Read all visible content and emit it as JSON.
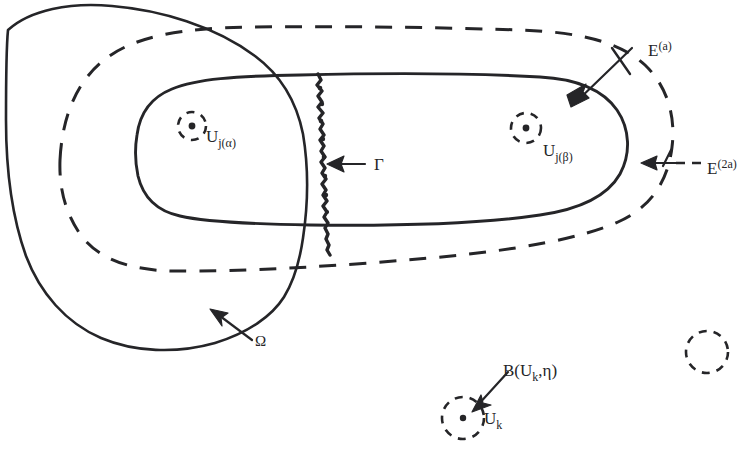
{
  "figure": {
    "background_color": "#ffffff",
    "ink_color": "#252528",
    "width": 751,
    "height": 455
  },
  "labels": {
    "e_a": {
      "base": "E",
      "exponent": "(a)",
      "full": "E^(a)"
    },
    "e_2a": {
      "base": "E",
      "exponent": "(2a)",
      "full": "E^(2a)"
    },
    "u_j_alpha": {
      "base": "U",
      "subscript": "j(α)",
      "full": "U_j(α)"
    },
    "u_j_beta": {
      "base": "U",
      "subscript": "j(β)",
      "full": "U_j(β)"
    },
    "gamma": {
      "full": "Γ"
    },
    "omega": {
      "full": "Ω"
    },
    "b_uk_eta": {
      "full": "B(U",
      "subscript": "k",
      "tail": ",η)"
    },
    "u_k": {
      "base": "U",
      "subscript": "k",
      "full": "U_k"
    }
  },
  "regions": [
    {
      "name": "omega-region",
      "style": "solid",
      "label": "Ω",
      "description": "outermost solid closed curve"
    },
    {
      "name": "e-2a-region",
      "style": "dashed",
      "label": "E^(2a)",
      "description": "middle dashed closed curve"
    },
    {
      "name": "e-a-region",
      "style": "solid",
      "label": "E^(a)",
      "description": "inner solid elongated closed curve"
    },
    {
      "name": "gamma-curve",
      "style": "jagged",
      "label": "Γ",
      "description": "jagged vertical curve crossing the inner region"
    }
  ],
  "neighborhoods": [
    {
      "name": "u-j-alpha-ball",
      "label": "U_j(α)",
      "has_center_dot": true,
      "cx": 192,
      "cy": 126,
      "r": 14
    },
    {
      "name": "u-j-beta-ball",
      "label": "U_j(β)",
      "has_center_dot": true,
      "cx": 526,
      "cy": 128,
      "r": 15
    },
    {
      "name": "u-k-ball",
      "label": "U_k",
      "has_center_dot": true,
      "cx": 463,
      "cy": 418,
      "r": 21
    },
    {
      "name": "unlabeled-ball",
      "label": "",
      "has_center_dot": false,
      "cx": 707,
      "cy": 352,
      "r": 21
    }
  ]
}
